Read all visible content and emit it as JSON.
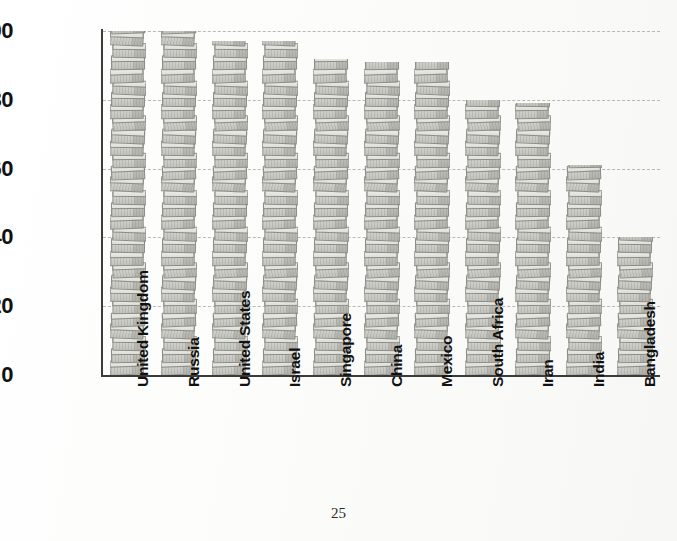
{
  "page": {
    "number": "25",
    "background_color": "#fbfbfa"
  },
  "chart_data": {
    "type": "bar",
    "title": "",
    "subtitle": "",
    "xlabel": "",
    "ylabel": "Number of people out of every 100 who can read and write",
    "ylim": [
      0,
      100
    ],
    "yticks": [
      0,
      20,
      40,
      60,
      80,
      100
    ],
    "ytick_labels": [
      "0",
      "20",
      "40",
      "60",
      "80",
      "100"
    ],
    "grid": "horizontal dashed gridlines at 20, 40, 60, 80, 100",
    "legend": "none",
    "bar_style": "pictorial bars drawn as vertical stacks of books",
    "bar_color": "#cfcfca",
    "bar_edge_color": "#8d8d87",
    "categories": [
      "United Kingdom",
      "Russia",
      "United States",
      "Israel",
      "Singapore",
      "China",
      "Mexico",
      "South Africa",
      "Iran",
      "India",
      "Bangladesh"
    ],
    "values": [
      100,
      100,
      97,
      97,
      92,
      91,
      91,
      80,
      79,
      61,
      40
    ]
  }
}
